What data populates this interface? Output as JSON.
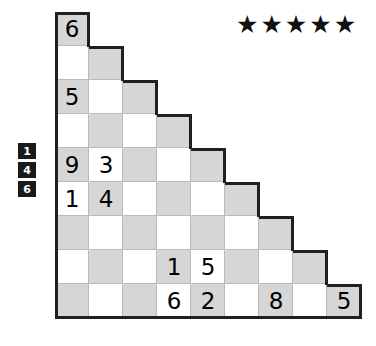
{
  "puzzle": {
    "type": "triangular-staircase-number-grid",
    "rating": {
      "label": "difficulty",
      "stars_filled": 5,
      "star_glyph": "★"
    },
    "colors": {
      "shaded_cell": "#d6d6d6",
      "light_cell": "#ffffff",
      "grid_outline": "#231f20",
      "inner_gridline": "#b9b9b9",
      "clue_box_background": "#1a1a1a",
      "clue_box_text": "#ffffff"
    },
    "row_clues": [
      {
        "value": "1"
      },
      {
        "value": "4"
      },
      {
        "value": "6"
      }
    ],
    "grid": {
      "rows": 9,
      "columns": 9,
      "cell_size_px": 34,
      "shading_rule": "checkerboard: shaded when (row + column) is even",
      "row_data": [
        {
          "index": 1,
          "cells": [
            {
              "col": 1,
              "shade": "shaded",
              "value": "6"
            }
          ]
        },
        {
          "index": 2,
          "cells": [
            {
              "col": 1,
              "shade": "light",
              "value": ""
            },
            {
              "col": 2,
              "shade": "shaded",
              "value": ""
            }
          ]
        },
        {
          "index": 3,
          "cells": [
            {
              "col": 1,
              "shade": "shaded",
              "value": "5"
            },
            {
              "col": 2,
              "shade": "light",
              "value": ""
            },
            {
              "col": 3,
              "shade": "shaded",
              "value": ""
            }
          ]
        },
        {
          "index": 4,
          "cells": [
            {
              "col": 1,
              "shade": "light",
              "value": ""
            },
            {
              "col": 2,
              "shade": "shaded",
              "value": ""
            },
            {
              "col": 3,
              "shade": "light",
              "value": ""
            },
            {
              "col": 4,
              "shade": "shaded",
              "value": ""
            }
          ]
        },
        {
          "index": 5,
          "cells": [
            {
              "col": 1,
              "shade": "shaded",
              "value": "9"
            },
            {
              "col": 2,
              "shade": "light",
              "value": "3"
            },
            {
              "col": 3,
              "shade": "shaded",
              "value": ""
            },
            {
              "col": 4,
              "shade": "light",
              "value": ""
            },
            {
              "col": 5,
              "shade": "shaded",
              "value": ""
            }
          ]
        },
        {
          "index": 6,
          "cells": [
            {
              "col": 1,
              "shade": "light",
              "value": "1"
            },
            {
              "col": 2,
              "shade": "shaded",
              "value": "4"
            },
            {
              "col": 3,
              "shade": "light",
              "value": ""
            },
            {
              "col": 4,
              "shade": "shaded",
              "value": ""
            },
            {
              "col": 5,
              "shade": "light",
              "value": ""
            },
            {
              "col": 6,
              "shade": "shaded",
              "value": ""
            }
          ]
        },
        {
          "index": 7,
          "cells": [
            {
              "col": 1,
              "shade": "shaded",
              "value": ""
            },
            {
              "col": 2,
              "shade": "light",
              "value": ""
            },
            {
              "col": 3,
              "shade": "shaded",
              "value": ""
            },
            {
              "col": 4,
              "shade": "light",
              "value": ""
            },
            {
              "col": 5,
              "shade": "shaded",
              "value": ""
            },
            {
              "col": 6,
              "shade": "light",
              "value": ""
            },
            {
              "col": 7,
              "shade": "shaded",
              "value": ""
            }
          ]
        },
        {
          "index": 8,
          "cells": [
            {
              "col": 1,
              "shade": "light",
              "value": ""
            },
            {
              "col": 2,
              "shade": "shaded",
              "value": ""
            },
            {
              "col": 3,
              "shade": "light",
              "value": ""
            },
            {
              "col": 4,
              "shade": "shaded",
              "value": "1"
            },
            {
              "col": 5,
              "shade": "light",
              "value": "5"
            },
            {
              "col": 6,
              "shade": "shaded",
              "value": ""
            },
            {
              "col": 7,
              "shade": "light",
              "value": ""
            },
            {
              "col": 8,
              "shade": "shaded",
              "value": ""
            }
          ]
        },
        {
          "index": 9,
          "cells": [
            {
              "col": 1,
              "shade": "shaded",
              "value": ""
            },
            {
              "col": 2,
              "shade": "light",
              "value": ""
            },
            {
              "col": 3,
              "shade": "shaded",
              "value": ""
            },
            {
              "col": 4,
              "shade": "light",
              "value": "6"
            },
            {
              "col": 5,
              "shade": "shaded",
              "value": "2"
            },
            {
              "col": 6,
              "shade": "light",
              "value": ""
            },
            {
              "col": 7,
              "shade": "shaded",
              "value": "8"
            },
            {
              "col": 8,
              "shade": "light",
              "value": ""
            },
            {
              "col": 9,
              "shade": "shaded",
              "value": "5"
            }
          ]
        }
      ]
    }
  }
}
